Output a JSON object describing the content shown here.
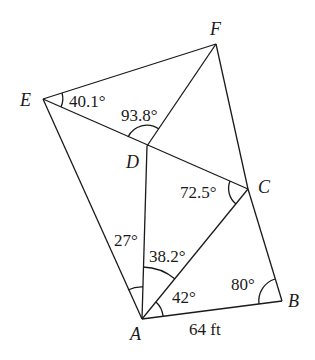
{
  "diagram": {
    "type": "geometry-figure",
    "points": {
      "A": {
        "label": "A",
        "x": 142,
        "y": 319
      },
      "B": {
        "label": "B",
        "x": 282,
        "y": 301
      },
      "C": {
        "label": "C",
        "x": 248,
        "y": 189
      },
      "D": {
        "label": "D",
        "x": 147,
        "y": 146
      },
      "E": {
        "label": "E",
        "x": 43,
        "y": 99
      },
      "F": {
        "label": "F",
        "x": 216,
        "y": 44
      }
    },
    "segments": [
      "EF",
      "FC",
      "CB",
      "BA",
      "AE",
      "ED",
      "DC",
      "DF",
      "AD",
      "AC"
    ],
    "angles": {
      "E": "40.1°",
      "D": "93.8°",
      "C": "72.5°",
      "A_left": "27°",
      "A_mid": "38.2°",
      "A_right": "42°",
      "B": "80°"
    },
    "side_label": "64 ft"
  }
}
